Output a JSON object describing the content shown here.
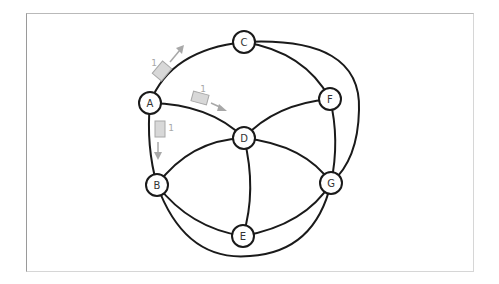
{
  "diagram": {
    "type": "network-graph",
    "colors": {
      "edge": "#1a1a1a",
      "node_fill": "#ffffff",
      "packet_fill": "#d8d8d8",
      "packet_stroke": "#a8a8a8",
      "arrow": "#a8a8a8"
    },
    "nodes": [
      {
        "id": "A",
        "label": "A",
        "x": 150,
        "y": 103
      },
      {
        "id": "B",
        "label": "B",
        "x": 157,
        "y": 185
      },
      {
        "id": "C",
        "label": "C",
        "x": 244,
        "y": 42
      },
      {
        "id": "D",
        "label": "D",
        "x": 244,
        "y": 138
      },
      {
        "id": "E",
        "label": "E",
        "x": 243,
        "y": 236
      },
      {
        "id": "F",
        "label": "F",
        "x": 330,
        "y": 99
      },
      {
        "id": "G",
        "label": "G",
        "x": 331,
        "y": 183
      }
    ],
    "edges": [
      [
        "A",
        "C"
      ],
      [
        "A",
        "D"
      ],
      [
        "A",
        "B"
      ],
      [
        "C",
        "F"
      ],
      [
        "C",
        "G"
      ],
      [
        "D",
        "B"
      ],
      [
        "D",
        "F"
      ],
      [
        "D",
        "G"
      ],
      [
        "D",
        "E"
      ],
      [
        "F",
        "G"
      ],
      [
        "B",
        "E"
      ],
      [
        "E",
        "G"
      ],
      [
        "B",
        "G"
      ]
    ],
    "packets": [
      {
        "from": "A",
        "toward": "C",
        "label": "1"
      },
      {
        "from": "A",
        "toward": "D",
        "label": "1"
      },
      {
        "from": "A",
        "toward": "B",
        "label": "1"
      }
    ]
  }
}
